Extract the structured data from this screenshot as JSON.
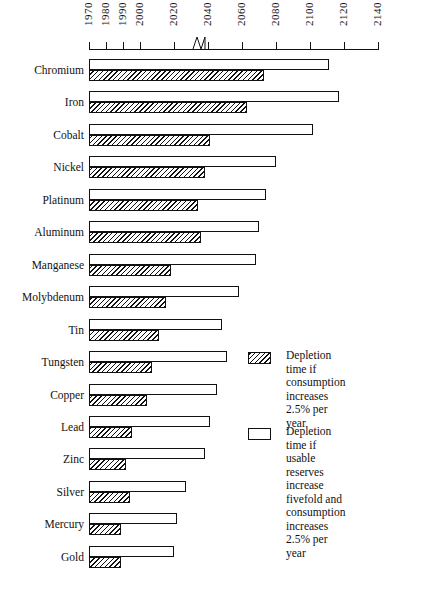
{
  "chart_data": {
    "type": "bar",
    "orientation": "horizontal",
    "title": "",
    "xlabel": "",
    "ylabel": "",
    "xlim": [
      1970,
      2140
    ],
    "grid": false,
    "axis_break": {
      "after": 2000,
      "before": 2020
    },
    "tick_labels": [
      "1970",
      "1980",
      "1990",
      "2000",
      "2020",
      "2040",
      "2060",
      "2080",
      "2100",
      "2120",
      "2140"
    ],
    "tick_values": [
      1970,
      1980,
      1990,
      2000,
      2020,
      2040,
      2060,
      2080,
      2100,
      2120,
      2140
    ],
    "categories": [
      "Chromium",
      "Iron",
      "Cobalt",
      "Nickel",
      "Platinum",
      "Aluminum",
      "Manganese",
      "Molybdenum",
      "Tin",
      "Tungsten",
      "Copper",
      "Lead",
      "Zinc",
      "Silver",
      "Mercury",
      "Gold"
    ],
    "series": [
      {
        "name": "Depletion time if usable reserves increase fivefold and consumption increases 2.5% per year",
        "style": "open",
        "values": [
          2111,
          2117,
          2102,
          2080,
          2074,
          2070,
          2068,
          2058,
          2048,
          2051,
          2045,
          2041,
          2038,
          2027,
          2022,
          2020
        ]
      },
      {
        "name": "Depletion time if consumption increases 2.5% per year",
        "style": "hatched",
        "values": [
          2073,
          2063,
          2041,
          2038,
          2034,
          2036,
          2018,
          2015,
          2011,
          2007,
          2004,
          1995,
          1992,
          1994,
          1989,
          1989
        ]
      }
    ],
    "legend_position": "right-middle"
  },
  "legend": {
    "items": [
      {
        "swatch": "hatched",
        "label": "Depletion time if\nconsumption increases\n2.5% per year"
      },
      {
        "swatch": "open",
        "label": "Depletion time if\nusable reserves increase\nfivefold and consumption\nincreases  2.5% per year"
      }
    ]
  },
  "colors": {
    "ink": "#111111",
    "background": "#ffffff"
  }
}
